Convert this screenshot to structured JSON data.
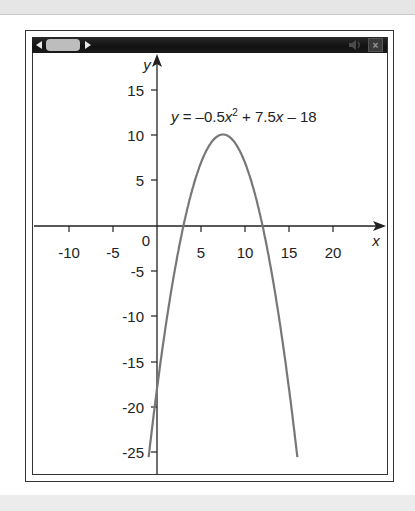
{
  "toolbar": {
    "left_arrow_icon": "arrow-left-icon",
    "slider_thumb": "slider-thumb",
    "right_arrow_icon": "arrow-right-icon",
    "speaker_icon": "speaker-icon",
    "close_label": "×"
  },
  "equation": {
    "y": "y",
    "equals_part": " = –0.5",
    "x1": "x",
    "exponent": "2",
    "plus_part": " + 7.5",
    "x2": "x",
    "tail": " – 18"
  },
  "chart_data": {
    "type": "line",
    "title": "",
    "annotation": "y = -0.5x^2 + 7.5x - 18",
    "xlabel": "x",
    "ylabel": "y",
    "xlim": [
      -14,
      26
    ],
    "ylim": [
      -27,
      18
    ],
    "x_ticks": [
      -10,
      -5,
      0,
      5,
      10,
      15,
      20
    ],
    "x_tick_labels": [
      "-10",
      "-5",
      "0",
      "5",
      "10",
      "15",
      "20"
    ],
    "y_ticks": [
      15,
      10,
      5,
      -5,
      -10,
      -15,
      -20,
      -25
    ],
    "y_tick_labels": [
      "15",
      "10",
      "5",
      "-5",
      "-10",
      "-15",
      "-20",
      "-25"
    ],
    "grid": false,
    "legend": null,
    "series": [
      {
        "name": "y = -0.5x^2 + 7.5x - 18",
        "color": "#777777",
        "x": [
          -1,
          0,
          1,
          2,
          3,
          4,
          5,
          6,
          7,
          7.5,
          8,
          9,
          10,
          11,
          12,
          13,
          14,
          15,
          16
        ],
        "values": [
          -26,
          -18,
          -11,
          -5,
          0,
          4,
          7,
          9,
          10,
          10.125,
          10,
          9,
          7,
          4,
          0,
          -5,
          -11,
          -18,
          -26
        ]
      }
    ],
    "roots": [
      3,
      12
    ],
    "vertex": [
      7.5,
      10.125
    ],
    "y_intercept": -18
  },
  "labels": {
    "x_axis": "x",
    "y_axis": "y",
    "x_ticks": [
      "-10",
      "-5",
      "5",
      "10",
      "15",
      "20"
    ],
    "origin": "0",
    "y_ticks_pos": [
      "15",
      "10",
      "5"
    ],
    "y_ticks_neg": [
      "-5",
      "-10",
      "-15",
      "-20",
      "-25"
    ]
  },
  "colors": {
    "curve": "#777777",
    "axes": "#222222",
    "toolbar": "#151515",
    "thumb": "#bdbdbd"
  }
}
